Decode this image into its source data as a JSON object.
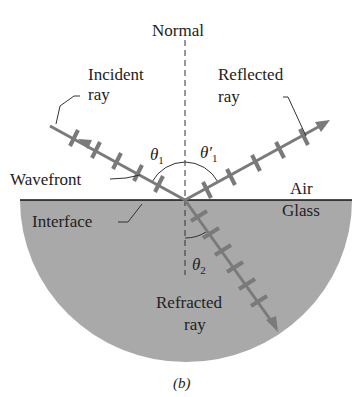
{
  "figure": {
    "caption": "(b)",
    "labels": {
      "normal": "Normal",
      "incident_line1": "Incident",
      "incident_line2": "ray",
      "reflected_line1": "Reflected",
      "reflected_line2": "ray",
      "wavefront": "Wavefront",
      "air": "Air",
      "glass": "Glass",
      "interface": "Interface",
      "refracted_line1": "Refracted",
      "refracted_line2": "ray",
      "theta1": "θ",
      "theta1_sub": "1",
      "theta1p": "θ′",
      "theta1p_sub": "1",
      "theta2": "θ",
      "theta2_sub": "2"
    },
    "colors": {
      "glass": "#a9a9a9",
      "ray": "#7a7a7a",
      "text": "#222222",
      "interface": "#111111"
    }
  }
}
